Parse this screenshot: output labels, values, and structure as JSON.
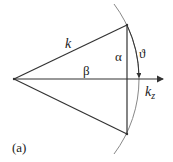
{
  "diagram": {
    "labels": {
      "hypotenuse": "k",
      "axis": "k",
      "axis_subscript": "z",
      "alpha": "α",
      "beta": "β",
      "theta": "ϑ",
      "panel": "(a)"
    },
    "colors": {
      "line": "#333333",
      "arc": "#777777",
      "text": "#222222"
    }
  }
}
